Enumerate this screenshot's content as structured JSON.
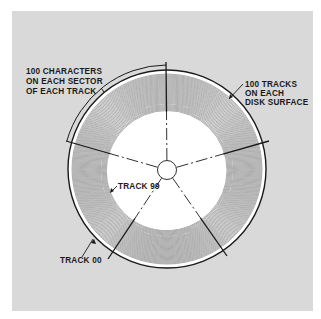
{
  "figure": {
    "colors": {
      "panel": "#d9d9d9",
      "ink": "#1a1a1a",
      "track_lines": "#6e6e6e",
      "hub": "#ffffff"
    },
    "disk": {
      "track_count": 100,
      "sector_count": 5,
      "first_track_label": "TRACK 00",
      "last_track_label": "TRACK 99"
    },
    "labels": {
      "sector_note": [
        "100 CHARACTERS",
        "ON EACH SECTOR",
        "OF EACH TRACK"
      ],
      "tracks_note": [
        "100 TRACKS",
        "ON EACH",
        "DISK SURFACE"
      ],
      "track_99": "TRACK 99",
      "track_00": "TRACK 00"
    }
  }
}
